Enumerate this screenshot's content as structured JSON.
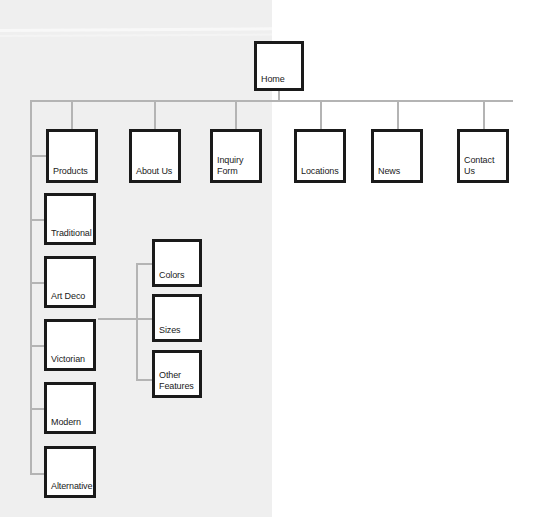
{
  "diagram": {
    "type": "tree",
    "colors": {
      "panel": "#efefef",
      "page": "#ffffff",
      "connector": "#b4b4b4",
      "node_border": "#1a1a1a",
      "node_fill": "#ffffff",
      "text": "#1a1a1a"
    },
    "root": {
      "label": "Home"
    },
    "level2": [
      {
        "label": "Products"
      },
      {
        "label": "About Us"
      },
      {
        "label": "Inquiry\nForm"
      },
      {
        "label": "Locations"
      },
      {
        "label": "News"
      },
      {
        "label": "Contact\nUs"
      }
    ],
    "products_children": [
      {
        "label": "Traditional"
      },
      {
        "label": "Art Deco"
      },
      {
        "label": "Victorian"
      },
      {
        "label": "Modern"
      },
      {
        "label": "Alternative"
      }
    ],
    "attribute_children": [
      {
        "label": "Colors"
      },
      {
        "label": "Sizes"
      },
      {
        "label": "Other\nFeatures"
      }
    ]
  }
}
